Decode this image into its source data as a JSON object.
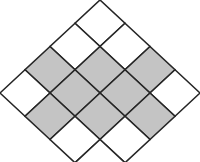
{
  "diagram": {
    "type": "rotated-square-grid",
    "rows": 4,
    "cols": 4,
    "colors": {
      "shaded": "#c4c4c4",
      "empty": "#ffffff",
      "line": "#262626"
    },
    "origin": {
      "x": 100,
      "y": 0
    },
    "step": {
      "x": 25,
      "y": 23.25
    },
    "cells": [
      {
        "i": 0,
        "j": 0,
        "shaded": false
      },
      {
        "i": 0,
        "j": 1,
        "shaded": false
      },
      {
        "i": 0,
        "j": 2,
        "shaded": true
      },
      {
        "i": 0,
        "j": 3,
        "shaded": false
      },
      {
        "i": 1,
        "j": 0,
        "shaded": false
      },
      {
        "i": 1,
        "j": 1,
        "shaded": true
      },
      {
        "i": 1,
        "j": 2,
        "shaded": true
      },
      {
        "i": 1,
        "j": 3,
        "shaded": true
      },
      {
        "i": 2,
        "j": 0,
        "shaded": true
      },
      {
        "i": 2,
        "j": 1,
        "shaded": true
      },
      {
        "i": 2,
        "j": 2,
        "shaded": true
      },
      {
        "i": 2,
        "j": 3,
        "shaded": false
      },
      {
        "i": 3,
        "j": 0,
        "shaded": false
      },
      {
        "i": 3,
        "j": 1,
        "shaded": true
      },
      {
        "i": 3,
        "j": 2,
        "shaded": false
      },
      {
        "i": 3,
        "j": 3,
        "shaded": false
      }
    ],
    "shaded_count": 8,
    "total_cells": 16
  }
}
